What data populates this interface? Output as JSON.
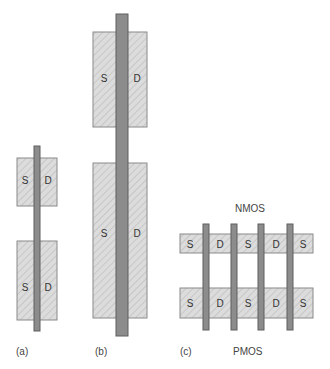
{
  "figure": {
    "panels": [
      {
        "id": "a",
        "caption": "(a)",
        "diffusions": [
          {
            "source": "S",
            "drain": "D"
          },
          {
            "source": "S",
            "drain": "D"
          }
        ]
      },
      {
        "id": "b",
        "caption": "(b)",
        "diffusions": [
          {
            "source": "S",
            "drain": "D"
          },
          {
            "source": "S",
            "drain": "D"
          }
        ]
      },
      {
        "id": "c",
        "caption": "(c)",
        "top_label": "NMOS",
        "bottom_label": "PMOS",
        "top_row": [
          "S",
          "D",
          "S",
          "D",
          "S"
        ],
        "bottom_row": [
          "S",
          "D",
          "S",
          "D",
          "S"
        ]
      }
    ],
    "colors": {
      "diffusion_fill": "#dcdcdc",
      "diffusion_hatch": "#bdbdbd",
      "diffusion_border": "#8a8a8a",
      "gate_fill": "#8c8c8c",
      "gate_border": "#5e5e5e"
    }
  }
}
